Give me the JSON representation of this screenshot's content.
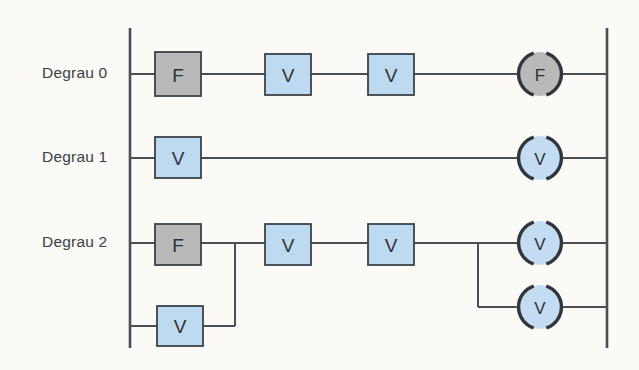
{
  "figure": {
    "type": "ladder-logic-diagram",
    "background_color": "#fbfaf7",
    "line_color": "#4a4f55",
    "contact_colors": {
      "normal": "#bedaf0",
      "alternate": "#b9b9b9"
    },
    "coil_colors": {
      "normal": "#c3dcf2",
      "alternate": "#b9b9b9"
    },
    "rails": {
      "left_x": 130,
      "right_x": 607,
      "top_y": 28,
      "bottom_y": 348
    }
  },
  "rungs": [
    {
      "label": "Degrau 0",
      "label_x": 42,
      "label_y": 64,
      "y": 74,
      "contacts": [
        {
          "text": "F",
          "kind": "alternate",
          "x": 155,
          "y": 52,
          "w": 46,
          "h": 44
        },
        {
          "text": "V",
          "kind": "normal",
          "x": 265,
          "y": 54,
          "w": 46,
          "h": 41
        },
        {
          "text": "V",
          "kind": "normal",
          "x": 368,
          "y": 54,
          "w": 46,
          "h": 41
        }
      ],
      "coils": [
        {
          "text": "F",
          "kind": "alternate",
          "cx": 540,
          "cy": 74,
          "r": 23
        }
      ]
    },
    {
      "label": "Degrau 1",
      "label_x": 42,
      "label_y": 148,
      "y": 158,
      "contacts": [
        {
          "text": "V",
          "kind": "normal",
          "x": 155,
          "y": 137,
          "w": 46,
          "h": 41
        }
      ],
      "coils": [
        {
          "text": "V",
          "kind": "normal",
          "cx": 540,
          "cy": 158,
          "r": 23
        }
      ]
    },
    {
      "label": "Degrau 2",
      "label_x": 42,
      "label_y": 233,
      "y": 243,
      "contacts": [
        {
          "text": "F",
          "kind": "alternate",
          "x": 155,
          "y": 224,
          "w": 46,
          "h": 41
        },
        {
          "text": "V",
          "kind": "normal",
          "x": 265,
          "y": 224,
          "w": 46,
          "h": 41
        },
        {
          "text": "V",
          "kind": "normal",
          "x": 368,
          "y": 224,
          "w": 46,
          "h": 41
        }
      ],
      "parallel_contacts": [
        {
          "text": "V",
          "kind": "normal",
          "x": 157,
          "y": 306,
          "w": 46,
          "h": 40,
          "branch_y": 326,
          "join_x": 235
        }
      ],
      "coils": [
        {
          "text": "V",
          "kind": "normal",
          "cx": 540,
          "cy": 243,
          "r": 23
        },
        {
          "text": "V",
          "kind": "normal",
          "cx": 540,
          "cy": 307,
          "r": 23
        }
      ],
      "coil_branch_x": 478
    }
  ]
}
